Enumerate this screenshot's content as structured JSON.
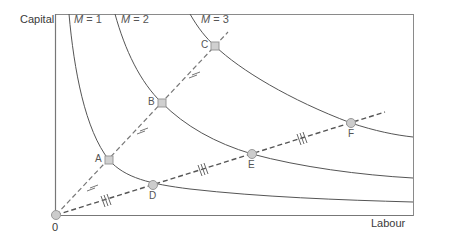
{
  "axes": {
    "y_label": "Capital",
    "x_label": "Labour",
    "origin_label": "0"
  },
  "isoquants": [
    {
      "label_var": "M",
      "label_eq": " = 1"
    },
    {
      "label_var": "M",
      "label_eq": " = 2"
    },
    {
      "label_var": "M",
      "label_eq": " = 3"
    }
  ],
  "points": {
    "steep_ray": [
      {
        "label": "A",
        "marker": "square"
      },
      {
        "label": "B",
        "marker": "square"
      },
      {
        "label": "C",
        "marker": "square"
      }
    ],
    "shallow_ray": [
      {
        "label": "D",
        "marker": "circle"
      },
      {
        "label": "E",
        "marker": "circle"
      },
      {
        "label": "F",
        "marker": "circle"
      }
    ]
  },
  "tick_marks": {
    "steep_ray": [
      "single",
      "double",
      "double"
    ],
    "shallow_ray": [
      "triple",
      "triple",
      "triple"
    ]
  },
  "colors": {
    "axis": "#777777",
    "curve": "#555555",
    "ray": "#666666",
    "marker_fill": "#cccccc",
    "marker_stroke": "#999999",
    "text": "#3a3a3a"
  }
}
